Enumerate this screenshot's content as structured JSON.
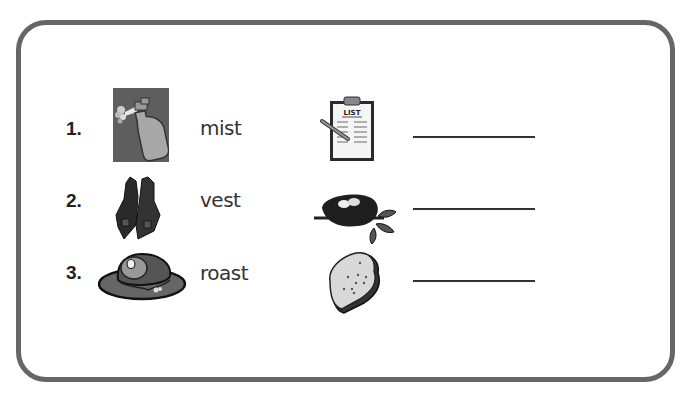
{
  "worksheet": {
    "rows": [
      {
        "number": "1.",
        "word": "mist",
        "left_picture": "spray-bottle-mist",
        "right_picture": "clipboard-list",
        "clipboard_label": "LIST",
        "answer": ""
      },
      {
        "number": "2.",
        "word": "vest",
        "left_picture": "vest",
        "right_picture": "bird-nest",
        "answer": ""
      },
      {
        "number": "3.",
        "word": "roast",
        "left_picture": "roast-on-platter",
        "right_picture": "toast-slice",
        "answer": ""
      }
    ]
  },
  "colors": {
    "frame_border": "#666666",
    "text": "#333333",
    "picture_dark": "#2a2a2a",
    "picture_mid": "#777777",
    "picture_light": "#aaaaaa"
  }
}
